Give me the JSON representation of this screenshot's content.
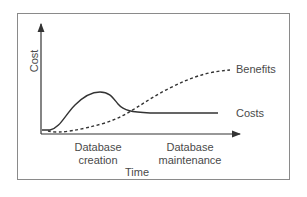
{
  "diagram": {
    "y_axis_label": "Cost",
    "x_axis_label": "Time",
    "phases": [
      {
        "label_line1": "Database",
        "label_line2": "creation"
      },
      {
        "label_line1": "Database",
        "label_line2": "maintenance"
      }
    ],
    "series": [
      {
        "name": "Benefits",
        "style": "dashed",
        "description": "Starts low, rises steadily over time, levelling off near top"
      },
      {
        "name": "Costs",
        "style": "solid",
        "description": "Peaks during database creation, then drops and levels off during maintenance"
      }
    ],
    "colors": {
      "line": "#333333",
      "frame": "#8a8a8a",
      "text": "#4a4a4a"
    }
  }
}
